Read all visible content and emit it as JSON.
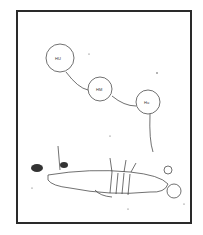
{
  "comic_panel": {
    "bubbles": [
      {
        "text": "HU",
        "cx": 60,
        "cy": 58,
        "r": 14
      },
      {
        "text": "HM",
        "cx": 100,
        "cy": 89,
        "r": 12
      },
      {
        "text": "Hu",
        "cx": 148,
        "cy": 102,
        "r": 12
      }
    ],
    "scene": "figure lying on ground pierced by arrows",
    "colors": {
      "ink": "#2a2a2a",
      "paper": "#ffffff"
    }
  }
}
